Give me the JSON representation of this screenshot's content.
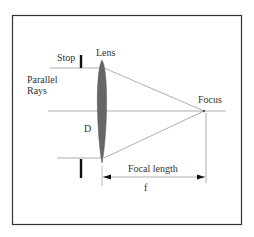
{
  "diagram": {
    "labels": {
      "stop": "Stop",
      "lens": "Lens",
      "parallel_rays_line1": "Parallel",
      "parallel_rays_line2": "Rays",
      "diameter": "D",
      "focus": "Focus",
      "focal_length": "Focal length",
      "f": "f"
    },
    "colors": {
      "frame": "#333333",
      "ray": "#999999",
      "lens": "#666666",
      "stop": "#111111",
      "text": "#333333"
    }
  }
}
